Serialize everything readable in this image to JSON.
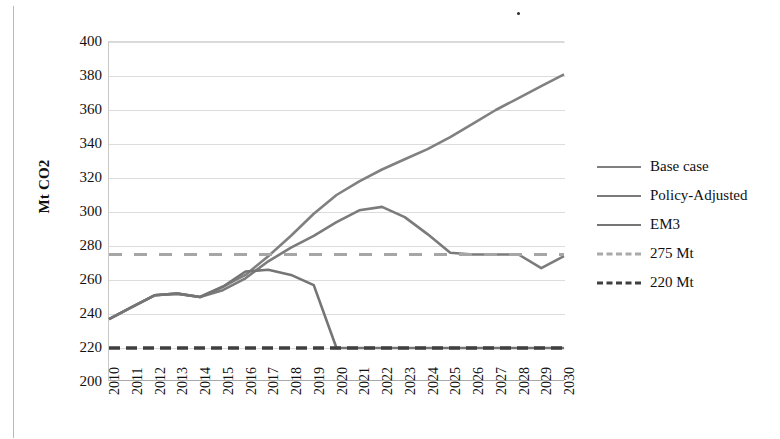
{
  "figure": {
    "y_axis_title": "Mt CO2"
  },
  "legend": {
    "items": [
      {
        "label": "Base case",
        "style": "solid",
        "color": "#808080"
      },
      {
        "label": "Policy-Adjusted",
        "style": "solid",
        "color": "#7b7b7b"
      },
      {
        "label": "EM3",
        "style": "solid",
        "color": "#757575"
      },
      {
        "label": "275 Mt",
        "style": "dashed",
        "color": "#a6a6a6"
      },
      {
        "label": "220 Mt",
        "style": "dashed",
        "color": "#3f3f3f"
      }
    ]
  },
  "chart_data": {
    "type": "line",
    "title": "",
    "xlabel": "",
    "ylabel": "Mt CO2",
    "ylim": [
      200,
      400
    ],
    "ytick_step": 20,
    "yticks": [
      400,
      380,
      360,
      340,
      320,
      300,
      280,
      260,
      240,
      220,
      200
    ],
    "grid": true,
    "legend_position": "right",
    "x": [
      2010,
      2011,
      2012,
      2013,
      2014,
      2015,
      2016,
      2017,
      2018,
      2019,
      2020,
      2021,
      2022,
      2023,
      2024,
      2025,
      2026,
      2027,
      2028,
      2029,
      2030
    ],
    "categories": [
      "2010",
      "2011",
      "2012",
      "2013",
      "2014",
      "2015",
      "2016",
      "2017",
      "2018",
      "2019",
      "2020",
      "2021",
      "2022",
      "2023",
      "2024",
      "2025",
      "2026",
      "2027",
      "2028",
      "2029",
      "2030"
    ],
    "series": [
      {
        "name": "Base case",
        "color": "#808080",
        "style": "solid",
        "values": [
          237,
          244,
          251,
          252,
          250,
          256,
          263,
          274,
          286,
          299,
          310,
          318,
          325,
          331,
          337,
          344,
          352,
          360,
          367,
          374,
          381
        ]
      },
      {
        "name": "Policy-Adjusted",
        "color": "#7b7b7b",
        "style": "solid",
        "values": [
          237,
          244,
          251,
          252,
          250,
          254,
          261,
          271,
          279,
          286,
          294,
          301,
          303,
          297,
          287,
          276,
          275,
          275,
          275,
          267,
          274
        ]
      },
      {
        "name": "EM3",
        "color": "#757575",
        "style": "solid",
        "values": [
          237,
          244,
          251,
          252,
          250,
          256,
          265,
          266,
          263,
          257,
          220,
          220,
          220,
          220,
          220,
          220,
          220,
          220,
          220,
          220,
          220
        ]
      },
      {
        "name": "275 Mt",
        "color": "#a6a6a6",
        "style": "dashed",
        "values": [
          275,
          275,
          275,
          275,
          275,
          275,
          275,
          275,
          275,
          275,
          275,
          275,
          275,
          275,
          275,
          275,
          275,
          275,
          275,
          275,
          275
        ]
      },
      {
        "name": "220 Mt",
        "color": "#3f3f3f",
        "style": "dashed",
        "values": [
          220,
          220,
          220,
          220,
          220,
          220,
          220,
          220,
          220,
          220,
          220,
          220,
          220,
          220,
          220,
          220,
          220,
          220,
          220,
          220,
          220
        ]
      }
    ]
  }
}
